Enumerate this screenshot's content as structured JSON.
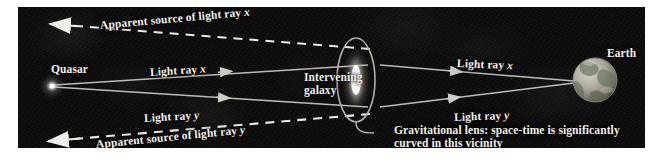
{
  "figure": {
    "type": "gravitational-lensing-diagram",
    "background_color": "#0a0a0a",
    "text_color": "#f2f0ea",
    "line_color": "#c9c6bd"
  },
  "labels": {
    "apparent_source_x": "Apparent source of light ray x",
    "apparent_source_y": "Apparent source of light ray y",
    "quasar": "Quasar",
    "light_ray_x_left": "Light ray x",
    "light_ray_y_left": "Light ray y",
    "light_ray_x_right": "Light ray x",
    "light_ray_y_right": "Light ray y",
    "intervening_galaxy": "Intervening galaxy",
    "earth": "Earth",
    "gravitational_lens_caption": "Gravitational lens: space-time is significantly curved in this vicinity"
  },
  "objects": {
    "quasar": {
      "name": "Quasar",
      "shape": "point-source-glow"
    },
    "galaxy": {
      "name": "Intervening galaxy",
      "shape": "vertical-ellipse-with-bright-core"
    },
    "earth": {
      "name": "Earth",
      "shape": "globe-with-continents"
    }
  },
  "rays": {
    "solid": [
      "light ray x",
      "light ray y"
    ],
    "dashed": [
      "apparent source of light ray x",
      "apparent source of light ray y"
    ]
  }
}
